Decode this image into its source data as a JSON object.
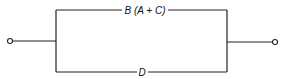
{
  "diagram": {
    "type": "parallel-circuit",
    "branches": [
      {
        "id": "top",
        "label": "B (A + C)"
      },
      {
        "id": "bottom",
        "label": "D"
      }
    ],
    "terminals": [
      "left",
      "right"
    ]
  }
}
